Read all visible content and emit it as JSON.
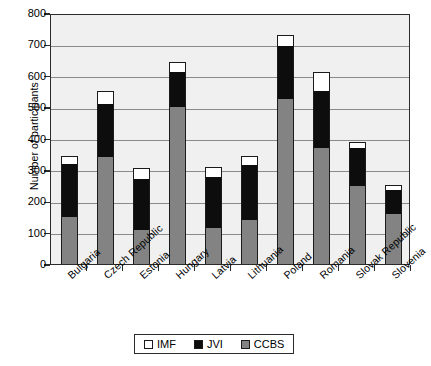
{
  "chart_data": {
    "type": "bar",
    "stacked": true,
    "title": "",
    "xlabel": "",
    "ylabel": "Number of participants",
    "ylim": [
      0,
      800
    ],
    "ytick_values": [
      0,
      100,
      200,
      300,
      400,
      500,
      600,
      700,
      800
    ],
    "ytick_labels": [
      "0",
      "100",
      "200",
      "300",
      "400",
      "500",
      "600",
      "700",
      "800"
    ],
    "grid": true,
    "legend_position": "bottom",
    "categories": [
      "Bulgaria",
      "Czech Republic",
      "Estonia",
      "Hungary",
      "Latvia",
      "Lithuania",
      "Poland",
      "Romania",
      "Slovak Republic",
      "Slovenia"
    ],
    "series": [
      {
        "name": "CCBS",
        "color": "#838383",
        "values": [
          150,
          340,
          110,
          500,
          115,
          140,
          525,
          370,
          250,
          160
        ]
      },
      {
        "name": "JVI",
        "color": "#0d0d0d",
        "values": [
          168,
          170,
          160,
          112,
          163,
          175,
          170,
          182,
          120,
          75
        ]
      },
      {
        "name": "IMF",
        "color": "#ffffff",
        "values": [
          27,
          40,
          35,
          33,
          32,
          28,
          35,
          60,
          20,
          18
        ]
      }
    ],
    "totals": [
      345,
      550,
      305,
      645,
      310,
      343,
      730,
      612,
      390,
      253
    ],
    "legend": [
      {
        "label": "IMF",
        "swatch": "imf"
      },
      {
        "label": "JVI",
        "swatch": "jvi"
      },
      {
        "label": "CCBS",
        "swatch": "ccbs"
      }
    ]
  }
}
